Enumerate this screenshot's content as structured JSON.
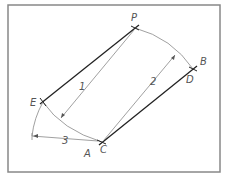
{
  "diagram": {
    "frame": {
      "x": 8,
      "y": 5,
      "width": 212,
      "height": 167,
      "color": "#888888"
    },
    "colors": {
      "heavy": "#222222",
      "light": "#888888",
      "text": "#555555"
    },
    "points": {
      "P": {
        "x": 135,
        "y": 28
      },
      "D": {
        "x": 193,
        "y": 69
      },
      "E": {
        "x": 43,
        "y": 102
      },
      "C": {
        "x": 102,
        "y": 142
      }
    },
    "labels": {
      "P": "P",
      "B": "B",
      "D": "D",
      "E": "E",
      "C": "C",
      "A": "A",
      "dim1": "1",
      "dim2": "2",
      "dim3": "3"
    }
  }
}
